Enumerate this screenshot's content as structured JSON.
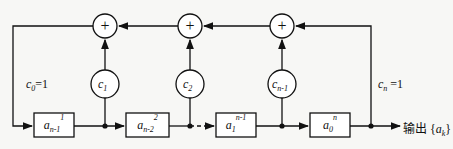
{
  "diagram": {
    "type": "linear-feedback-shift-register",
    "adders": [
      {
        "id": "adder-1",
        "symbol": "+"
      },
      {
        "id": "adder-2",
        "symbol": "+"
      },
      {
        "id": "adder-3",
        "symbol": "+"
      }
    ],
    "coefficients": [
      {
        "base": "c",
        "sub": "1"
      },
      {
        "base": "c",
        "sub": "2"
      },
      {
        "base": "c",
        "sub": "n-1"
      }
    ],
    "registers": [
      {
        "base": "a",
        "sub": "n-1",
        "sup": "1"
      },
      {
        "base": "a",
        "sub": "n-2",
        "sup": "2"
      },
      {
        "base": "a",
        "sub": "1",
        "sup": "n-1"
      },
      {
        "base": "a",
        "sub": "0",
        "sup": "n"
      }
    ],
    "labels": {
      "c0": {
        "base": "c",
        "sub": "0",
        "rest": "=1"
      },
      "cn": {
        "base": "c",
        "sub": "n",
        "rest": " =1"
      },
      "output_prefix": "输出",
      "output_set_open": "{",
      "output_var": "a",
      "output_sub": "k",
      "output_set_close": "}"
    },
    "colors": {
      "line": "#111111",
      "background": "#f7f7f5"
    }
  }
}
